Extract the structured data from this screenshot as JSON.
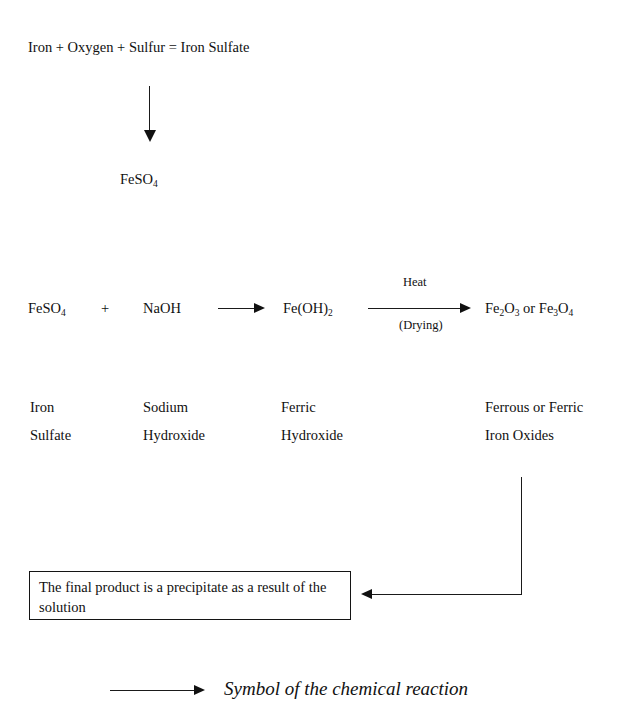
{
  "document": {
    "title": "Iron Sulfate Chemical Reaction Flow Diagram",
    "background_color": "#ffffff",
    "ink_color": "#111111"
  },
  "word_equation": {
    "text": "Iron + Oxygen + Sulfur = Iron Sulfate"
  },
  "intermediate": {
    "formula_main": "FeSO",
    "formula_sub": "4"
  },
  "reaction": {
    "reactant_1": {
      "main": "FeSO",
      "sub": "4"
    },
    "plus": "+",
    "reactant_2": {
      "main": "NaOH",
      "sub": ""
    },
    "product_1": {
      "main_a": "Fe(OH)",
      "sub_a": "2"
    },
    "condition_above": "Heat",
    "condition_below": "(Drying)",
    "product_2": {
      "part_a_main": "Fe",
      "part_a_sub1": "2",
      "part_a_mid": "O",
      "part_a_sub2": "3",
      "conjunction": " or ",
      "part_b_main": "Fe",
      "part_b_sub1": "3",
      "part_b_mid": "O",
      "part_b_sub2": "4"
    }
  },
  "names": [
    {
      "line1": "Iron",
      "line2": "Sulfate"
    },
    {
      "line1": "Sodium",
      "line2": "Hydroxide"
    },
    {
      "line1": "Ferric",
      "line2": "Hydroxide"
    },
    {
      "line1": "Ferrous or Ferric",
      "line2": "Iron Oxides"
    }
  ],
  "result_box": {
    "line1": "The final product is a precipitate as a result of the",
    "line2": "solution"
  },
  "legend": {
    "label": "Symbol of the chemical reaction"
  }
}
